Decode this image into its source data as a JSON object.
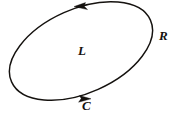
{
  "figure": {
    "type": "oriented-closed-curve-diagram",
    "background_color": "#ffffff",
    "stroke_color": "#15120f",
    "canvas": {
      "width": 175,
      "height": 119
    },
    "curve": {
      "name": "ellipse",
      "center_x": 81,
      "center_y": 51,
      "radius_x": 76,
      "radius_y": 42,
      "rotation_degrees": -24,
      "closed": true,
      "orientation": "clockwise-on-screen"
    },
    "arrows": [
      {
        "id": "top-arrow",
        "position_x": 83,
        "position_y": 7,
        "direction": "left",
        "angle_degrees": 190,
        "description": "arrowhead on upper arc pointing left"
      },
      {
        "id": "bottom-arrow",
        "position_x": 83,
        "position_y": 98,
        "direction": "right",
        "angle_degrees": 8,
        "description": "arrowhead on lower arc pointing right"
      }
    ],
    "labels": [
      {
        "id": "label-L",
        "text": "L",
        "meaning": "interior-region-label",
        "x": 78,
        "y": 44
      },
      {
        "id": "label-R",
        "text": "R",
        "meaning": "exterior-region-label",
        "x": 159,
        "y": 29
      },
      {
        "id": "label-C",
        "text": "C",
        "meaning": "curve-label",
        "x": 82,
        "y": 99
      }
    ]
  }
}
